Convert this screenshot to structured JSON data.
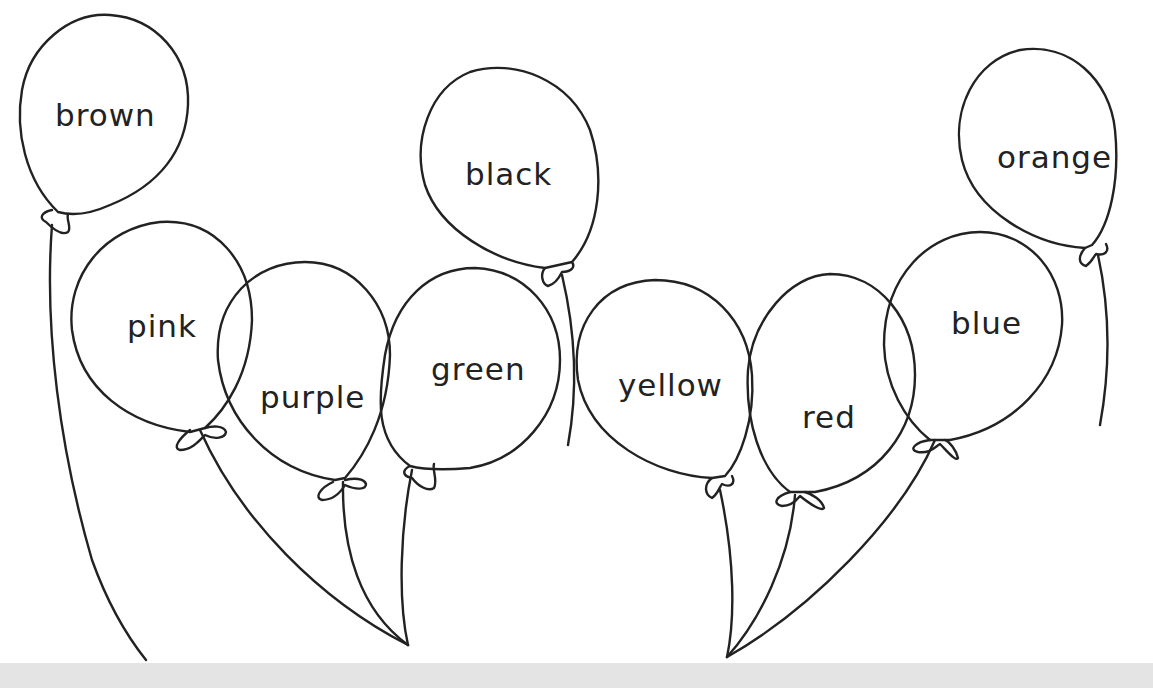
{
  "page": {
    "line_color": "#222222",
    "background": "#ffffff",
    "footer_band_color": "#e4e4e4"
  },
  "balloons": [
    {
      "id": "brown",
      "label": "brown"
    },
    {
      "id": "pink",
      "label": "pink"
    },
    {
      "id": "purple",
      "label": "purple"
    },
    {
      "id": "green",
      "label": "green"
    },
    {
      "id": "black",
      "label": "black"
    },
    {
      "id": "yellow",
      "label": "yellow"
    },
    {
      "id": "red",
      "label": "red"
    },
    {
      "id": "blue",
      "label": "blue"
    },
    {
      "id": "orange",
      "label": "orange"
    }
  ]
}
